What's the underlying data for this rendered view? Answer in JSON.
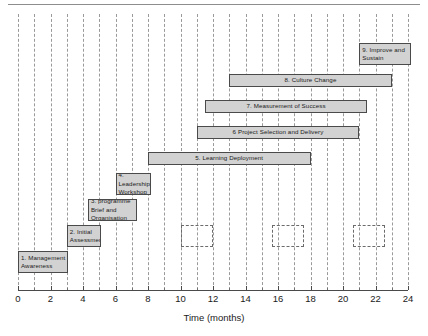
{
  "chart_data": {
    "type": "bar",
    "chart_style": "gantt",
    "title": "",
    "xlabel": "Time (months)",
    "ylabel": "",
    "xlim": [
      0,
      24
    ],
    "xticks": [
      0,
      2,
      4,
      6,
      8,
      10,
      12,
      14,
      16,
      18,
      20,
      22,
      24
    ],
    "xtick_labels": [
      "0",
      "2",
      "4",
      "6",
      "8",
      "10",
      "12",
      "14",
      "16",
      "18",
      "20",
      "22",
      "24"
    ],
    "minor_tick_interval": 1,
    "grid": "vertical dashed gridlines at every month",
    "legend": "none",
    "bar_fill_color": "#d2d2d2",
    "bar_border_color": "#4a4a4a",
    "tasks": [
      {
        "id": 9,
        "label": "9. Improve and Sustain",
        "start": 21.0,
        "end": 24.2,
        "row": 0,
        "align": "left",
        "two_line": true
      },
      {
        "id": 8,
        "label": "8. Culture Change",
        "start": 13.0,
        "end": 23.0,
        "row": 1,
        "align": "center",
        "two_line": false
      },
      {
        "id": 7,
        "label": "7. Measurement of Success",
        "start": 11.5,
        "end": 21.5,
        "row": 2,
        "align": "center",
        "two_line": false
      },
      {
        "id": 6,
        "label": "6 Project Selection and Delivery",
        "start": 11.0,
        "end": 21.0,
        "row": 3,
        "align": "center",
        "two_line": false
      },
      {
        "id": 5,
        "label": "5. Learning Deployment",
        "start": 8.0,
        "end": 18.0,
        "row": 4,
        "align": "center",
        "two_line": false
      },
      {
        "id": 4,
        "label": "4. Leadership Workshop",
        "start": 6.0,
        "end": 8.2,
        "row": 5,
        "align": "left",
        "two_line": true
      },
      {
        "id": 3,
        "label": "3. programme Brief and Organisation",
        "start": 4.3,
        "end": 7.3,
        "row": 6,
        "align": "left",
        "two_line": true
      },
      {
        "id": 2,
        "label": "2. Initial Assessment",
        "start": 3.0,
        "end": 5.1,
        "row": 7,
        "align": "left",
        "two_line": true
      },
      {
        "id": 1,
        "label": "1. Management Awareness",
        "start": 0.0,
        "end": 3.1,
        "row": 8,
        "align": "left",
        "two_line": true
      }
    ],
    "milestone_boxes": [
      {
        "start": 10.0,
        "end": 12.0,
        "row": 7
      },
      {
        "start": 15.6,
        "end": 17.6,
        "row": 7
      },
      {
        "start": 20.6,
        "end": 22.6,
        "row": 7
      }
    ]
  }
}
